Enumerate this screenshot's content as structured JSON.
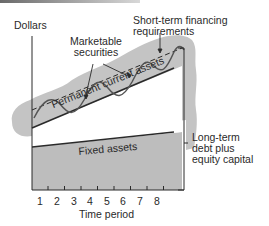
{
  "diagram": {
    "y_axis_label": "Dollars",
    "x_axis_label": "Time period",
    "x_ticks": [
      "1",
      "2",
      "3",
      "4",
      "5",
      "6",
      "7",
      "8"
    ],
    "labels": {
      "marketable_securities_line1": "Marketable",
      "marketable_securities_line2": "securities",
      "short_term_line1": "Short-term financing",
      "short_term_line2": "requirements",
      "permanent_current_assets": "Permanent current assets",
      "fixed_assets": "Fixed assets",
      "long_term_line1": "Long-term",
      "long_term_line2": "debt plus",
      "long_term_line3": "equity capital"
    },
    "colors": {
      "fill_gray": "#bdbdbd",
      "blob_gray": "#c4c4c4",
      "line": "#2a2a2a",
      "wave": "#555555"
    }
  }
}
